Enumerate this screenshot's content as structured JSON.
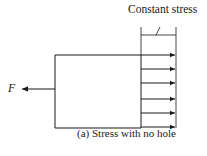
{
  "diagram": {
    "label_top": "Constant stress",
    "force_label": "F",
    "caption": "(a)  Stress with no hole",
    "stress_arrow_count": 6
  }
}
